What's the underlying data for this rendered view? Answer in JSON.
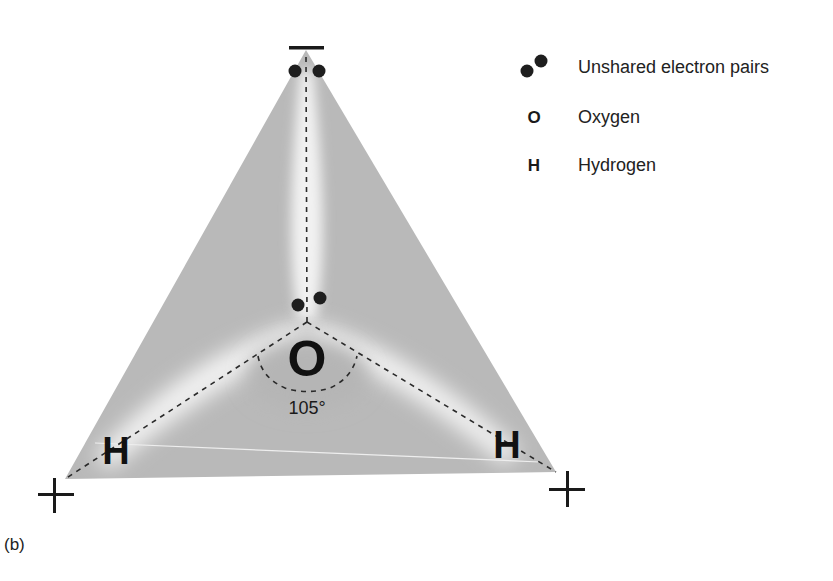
{
  "figure": {
    "panel_label": "(b)",
    "molecule": "water",
    "atoms": {
      "oxygen_symbol": "O",
      "hydrogen_left_symbol": "H",
      "hydrogen_right_symbol": "H"
    },
    "bond_angle": "105°",
    "charges": {
      "top": "−",
      "bottom_left": "+",
      "bottom_right": "+"
    },
    "colors": {
      "tetrahedron_fill": "#b9b9b9",
      "lobe_highlight": "#f4f4f4",
      "ink": "#1a1a1a"
    }
  },
  "legend": {
    "items": [
      {
        "symbol": "electron-pair",
        "label": "Unshared electron pairs"
      },
      {
        "symbol": "O",
        "label": "Oxygen"
      },
      {
        "symbol": "H",
        "label": "Hydrogen"
      }
    ]
  }
}
